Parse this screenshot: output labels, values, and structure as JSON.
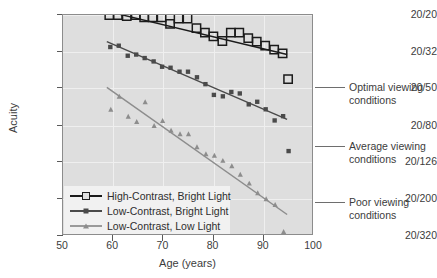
{
  "figure": {
    "background_color": "#ffffff",
    "plot_background_color": "#dedede"
  },
  "axes": {
    "x_label": "Age (years)",
    "y_label": "Acuity",
    "x_ticks": [
      "50",
      "60",
      "70",
      "80",
      "90",
      "100"
    ],
    "y_ticks": [
      "20/20",
      "20/32",
      "20/50",
      "20/80",
      "20/126",
      "20/200",
      "20/320"
    ]
  },
  "legend": {
    "items": [
      {
        "label": "High-Contrast, Bright Light",
        "marker": "open-square",
        "color": "#1b1b1b"
      },
      {
        "label": "Low-Contrast, Bright Light",
        "marker": "filled-square",
        "color": "#4a4a4a"
      },
      {
        "label": "Low-Contrast, Low Light",
        "marker": "filled-triangle",
        "color": "#8d8d8d"
      }
    ]
  },
  "annotations": [
    {
      "text": "Optimal viewing\nconditions",
      "name": "annotation-optimal"
    },
    {
      "text": "Average viewing\nconditions",
      "name": "annotation-average"
    },
    {
      "text": "Poor viewing\nconditions",
      "name": "annotation-poor"
    }
  ],
  "chart_data": {
    "type": "scatter",
    "title": "",
    "xlabel": "Age (years)",
    "ylabel": "Acuity",
    "xlim": [
      50,
      100
    ],
    "ylim_labels": [
      "20/20",
      "20/320"
    ],
    "x_ticks": [
      50,
      60,
      70,
      80,
      90,
      100
    ],
    "y_ticks": [
      "20/20",
      "20/32",
      "20/50",
      "20/80",
      "20/126",
      "20/200",
      "20/320"
    ],
    "y_scale": "log-acuity (Snellen denominator)",
    "grid": true,
    "legend_position": "lower-left inside axes",
    "series": [
      {
        "name": "High-Contrast, Bright Light",
        "marker": "open-square",
        "color": "#1b1b1b",
        "annotation": "Optimal viewing conditions",
        "points": [
          [
            59.3,
            20.0
          ],
          [
            61.0,
            20.0
          ],
          [
            62.8,
            20.3
          ],
          [
            64.6,
            20.0
          ],
          [
            66.3,
            20.6
          ],
          [
            68.0,
            20.6
          ],
          [
            69.8,
            20.6
          ],
          [
            71.5,
            22.4
          ],
          [
            73.2,
            20.9
          ],
          [
            75.0,
            20.9
          ],
          [
            76.8,
            23.6
          ],
          [
            78.5,
            25.0
          ],
          [
            80.2,
            26.2
          ],
          [
            82.0,
            27.8
          ],
          [
            83.7,
            25.0
          ],
          [
            85.4,
            25.0
          ],
          [
            87.2,
            26.8
          ],
          [
            88.9,
            28.0
          ],
          [
            90.6,
            29.5
          ],
          [
            92.4,
            31.0
          ],
          [
            94.1,
            32.5
          ],
          [
            95.2,
            45.0
          ]
        ],
        "trend_line": {
          "x0": 58.6,
          "y0": 19.0,
          "x1": 95.0,
          "y1": 33.0
        }
      },
      {
        "name": "Low-Contrast, Bright Light",
        "marker": "filled-square",
        "color": "#4a4a4a",
        "annotation": "Average viewing conditions",
        "points": [
          [
            59.5,
            30.0
          ],
          [
            61.2,
            29.5
          ],
          [
            63.0,
            33.5
          ],
          [
            64.7,
            33.0
          ],
          [
            66.4,
            34.5
          ],
          [
            68.2,
            36.0
          ],
          [
            69.9,
            38.5
          ],
          [
            71.6,
            39.0
          ],
          [
            73.4,
            41.0
          ],
          [
            75.1,
            41.0
          ],
          [
            76.9,
            44.0
          ],
          [
            78.6,
            48.0
          ],
          [
            80.3,
            55.0
          ],
          [
            82.1,
            56.0
          ],
          [
            83.8,
            53.0
          ],
          [
            85.5,
            54.0
          ],
          [
            87.3,
            62.0
          ],
          [
            89.0,
            60.0
          ],
          [
            90.7,
            66.0
          ],
          [
            92.5,
            76.0
          ],
          [
            94.2,
            72.0
          ],
          [
            95.3,
            112.0
          ]
        ],
        "trend_line": {
          "x0": 58.8,
          "y0": 28.0,
          "x1": 95.0,
          "y1": 75.0
        }
      },
      {
        "name": "Low-Contrast, Low Light",
        "marker": "filled-triangle",
        "color": "#8d8d8d",
        "annotation": "Poor viewing conditions",
        "points": [
          [
            59.6,
            66.0
          ],
          [
            61.3,
            56.0
          ],
          [
            63.1,
            72.0
          ],
          [
            64.8,
            77.0
          ],
          [
            66.5,
            60.0
          ],
          [
            68.3,
            81.0
          ],
          [
            70.0,
            76.0
          ],
          [
            71.7,
            86.0
          ],
          [
            73.5,
            90.0
          ],
          [
            75.2,
            90.0
          ],
          [
            76.9,
            106.0
          ],
          [
            78.7,
            116.0
          ],
          [
            80.4,
            118.0
          ],
          [
            82.1,
            126.0
          ],
          [
            83.9,
            135.0
          ],
          [
            85.6,
            150.0
          ],
          [
            87.4,
            168.0
          ],
          [
            89.1,
            190.0
          ],
          [
            90.8,
            205.0
          ],
          [
            92.6,
            220.0
          ],
          [
            94.3,
            310.0
          ]
        ],
        "trend_line": {
          "x0": 58.8,
          "y0": 50.0,
          "x1": 95.0,
          "y1": 250.0
        }
      }
    ]
  }
}
